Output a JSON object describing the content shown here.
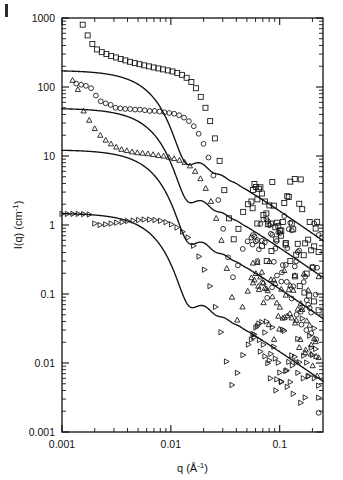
{
  "figure": {
    "panel_label": "|",
    "background": "#ffffff",
    "ink_color": "#111111"
  },
  "chart_data": {
    "type": "scatter",
    "title": "",
    "subtitle": "",
    "xlabel": "q (Å⁻¹)",
    "ylabel": "I(q) (cm⁻¹)",
    "xscale": "log",
    "yscale": "log",
    "xlim": [
      0.001,
      0.25
    ],
    "ylim": [
      0.001,
      1000
    ],
    "xticks": [
      0.001,
      0.01,
      0.1
    ],
    "xtick_labels": [
      "0.001",
      "0.01",
      "0.1"
    ],
    "yticks": [
      0.001,
      0.01,
      0.1,
      1,
      10,
      100,
      1000
    ],
    "ytick_labels": [
      "0.001",
      "0.01",
      "0.1",
      "1",
      "10",
      "100",
      "1000"
    ],
    "grid": false,
    "legend": "none",
    "annotations": [],
    "series": [
      {
        "name": "dataset-1",
        "marker": "square",
        "plateau": 170,
        "fit_radius_A": 310,
        "fit_label": "model fit",
        "points_x": [
          0.00155,
          0.00172,
          0.0019,
          0.0021,
          0.00232,
          0.00256,
          0.00283,
          0.00313,
          0.00346,
          0.00382,
          0.00422,
          0.00466,
          0.00515,
          0.00569,
          0.00629,
          0.00695,
          0.00768,
          0.00848,
          0.00937,
          0.01035,
          0.01144,
          0.01264,
          0.01396,
          0.01543,
          0.01704,
          0.01883,
          0.0208,
          0.02298,
          0.02539,
          0.02805,
          0.03099,
          0.03424,
          0.03783,
          0.0418,
          0.04618,
          0.05103,
          0.05638,
          0.06229,
          0.06883,
          0.07605,
          0.08402,
          0.09283,
          0.10257,
          0.11333,
          0.12521,
          0.13834,
          0.15285,
          0.16888,
          0.1866,
          0.20617,
          0.2278
        ],
        "points_y": [
          800,
          560,
          420,
          350,
          320,
          300,
          282,
          268,
          255,
          243,
          232,
          222,
          214,
          206,
          199,
          192,
          186,
          180,
          174,
          168,
          160,
          150,
          136,
          118,
          96,
          72,
          50,
          32,
          18.0,
          8.5,
          3.2,
          1.25,
          0.62,
          0.88,
          1.55,
          2.0,
          1.75,
          1.05,
          0.5,
          0.3,
          0.42,
          0.62,
          0.7,
          0.52,
          0.3,
          0.18,
          0.13,
          0.105,
          0.095,
          0.078,
          0.058
        ]
      },
      {
        "name": "dataset-2",
        "marker": "circle",
        "plateau": 48,
        "fit_radius_A": 300,
        "fit_label": "model fit",
        "points_x": [
          0.00135,
          0.0015,
          0.00166,
          0.00185,
          0.00205,
          0.00227,
          0.00252,
          0.0028,
          0.0031,
          0.00344,
          0.00381,
          0.00423,
          0.00469,
          0.0052,
          0.00577,
          0.0064,
          0.0071,
          0.00787,
          0.00873,
          0.00968,
          0.01074,
          0.01191,
          0.01321,
          0.01465,
          0.01625,
          0.01802,
          0.01999,
          0.02217,
          0.02459,
          0.02727,
          0.03024,
          0.03354,
          0.0372,
          0.04126,
          0.04576,
          0.05075,
          0.05628,
          0.06242,
          0.06923,
          0.07678,
          0.08516,
          0.09445,
          0.10476,
          0.11619,
          0.12887,
          0.14293,
          0.15853,
          0.17583,
          0.19502,
          0.21631,
          0.228
        ],
        "points_y": [
          112,
          108,
          104,
          96,
          75,
          62,
          58,
          55,
          50,
          49,
          48,
          48,
          47,
          47,
          46,
          45,
          45,
          44,
          43,
          42,
          41,
          39,
          36,
          32,
          27,
          21,
          15,
          9.5,
          5.2,
          2.3,
          0.88,
          0.34,
          0.175,
          0.26,
          0.45,
          0.58,
          0.52,
          0.3,
          0.145,
          0.088,
          0.125,
          0.185,
          0.205,
          0.15,
          0.086,
          0.05,
          0.036,
          0.03,
          0.027,
          0.022,
          0.0019
        ]
      },
      {
        "name": "dataset-3",
        "marker": "triangle-up",
        "plateau": 12,
        "fit_radius_A": 295,
        "fit_label": "model fit",
        "points_x": [
          0.00125,
          0.0014,
          0.00158,
          0.00178,
          0.002,
          0.00225,
          0.00252,
          0.00282,
          0.00315,
          0.00352,
          0.00394,
          0.0044,
          0.00492,
          0.0055,
          0.00615,
          0.00687,
          0.00768,
          0.00858,
          0.00959,
          0.01072,
          0.01198,
          0.01339,
          0.01497,
          0.01673,
          0.0187,
          0.0209,
          0.02336,
          0.02611,
          0.02918,
          0.03261,
          0.03645,
          0.04074,
          0.04553,
          0.05089,
          0.05688,
          0.06357,
          0.07106,
          0.07942,
          0.08877,
          0.09922,
          0.1109,
          0.12395,
          0.13854,
          0.15485,
          0.17307,
          0.19344,
          0.2162,
          0.228
        ],
        "points_y": [
          125,
          92,
          45,
          33,
          25,
          20,
          17.0,
          15.0,
          13.5,
          12.5,
          12.0,
          11.5,
          11.2,
          11.0,
          10.8,
          10.5,
          10.2,
          10.0,
          9.6,
          9.2,
          8.7,
          8.1,
          7.2,
          6.0,
          4.7,
          3.4,
          2.2,
          1.25,
          0.6,
          0.235,
          0.09,
          0.042,
          0.065,
          0.11,
          0.145,
          0.13,
          0.075,
          0.036,
          0.022,
          0.031,
          0.046,
          0.052,
          0.038,
          0.022,
          0.0155,
          0.0135,
          0.0125,
          0.012
        ]
      },
      {
        "name": "dataset-4",
        "marker": "triangle-right",
        "plateau": 1.45,
        "fit_radius_A": 290,
        "fit_label": "model fit",
        "points_x": [
          0.001,
          0.00112,
          0.00126,
          0.00141,
          0.00158,
          0.00178,
          0.002,
          0.00224,
          0.00252,
          0.00283,
          0.00318,
          0.00357,
          0.00401,
          0.0045,
          0.00506,
          0.00568,
          0.00638,
          0.00716,
          0.00805,
          0.00904,
          0.01015,
          0.0114,
          0.01281,
          0.01438,
          0.01616,
          0.01815,
          0.02038,
          0.02289,
          0.02571,
          0.02888,
          0.03244,
          0.03644,
          0.04093,
          0.04597,
          0.05164,
          0.058,
          0.06514,
          0.07317,
          0.08218,
          0.0923,
          0.10367,
          0.11644,
          0.13078,
          0.1469,
          0.16499,
          0.18532,
          0.20814,
          0.228
        ],
        "points_y": [
          1.45,
          1.45,
          1.45,
          1.45,
          1.44,
          1.42,
          1.05,
          1.0,
          1.02,
          1.05,
          1.08,
          1.1,
          1.14,
          1.16,
          1.18,
          1.2,
          1.2,
          1.18,
          1.15,
          1.1,
          1.02,
          0.92,
          0.8,
          0.66,
          0.5,
          0.35,
          0.225,
          0.13,
          0.065,
          0.028,
          0.0105,
          0.0048,
          0.0072,
          0.013,
          0.0185,
          0.0235,
          0.0215,
          0.0125,
          0.006,
          0.004,
          0.0053,
          0.0078,
          0.0092,
          0.0072,
          0.006,
          0.0065,
          0.006,
          0.0047
        ]
      }
    ]
  }
}
